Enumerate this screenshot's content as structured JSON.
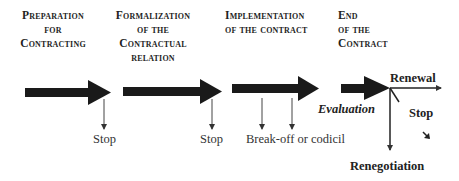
{
  "phases": [
    {
      "lines": [
        "Preparation",
        "for",
        "Contracting"
      ]
    },
    {
      "lines": [
        "Formalization",
        "of the",
        "Contractual",
        "relation"
      ]
    },
    {
      "lines": [
        "Implementation",
        "of the contract"
      ]
    },
    {
      "lines": [
        "End",
        "of the",
        "Contract"
      ]
    }
  ],
  "labels": {
    "stop_1": "Stop",
    "stop_2": "Stop",
    "break_off": "Break-off or codicil",
    "evaluation": "Evaluation",
    "renewal": "Renewal",
    "stop_end": "Stop",
    "renegotiation": "Renegotiation"
  },
  "colors": {
    "arrow": "#1a1a1a",
    "thin_line": "#444444",
    "background": "#ffffff"
  }
}
